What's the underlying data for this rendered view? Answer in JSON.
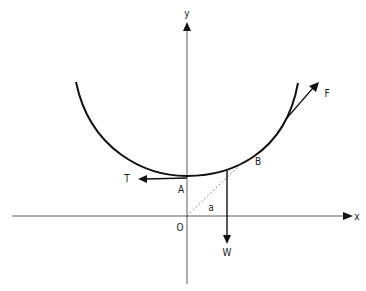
{
  "diagram": {
    "type": "free-body diagram on curve",
    "axes": {
      "x_label": "x",
      "y_label": "y",
      "origin_label": "O"
    },
    "points": {
      "A": "A",
      "B": "B"
    },
    "forces": {
      "tension": "T",
      "weight": "W",
      "applied": "F"
    },
    "angle_label": "a",
    "colors": {
      "stroke": "#111111",
      "axis": "#333333",
      "dashed": "#777777"
    }
  }
}
